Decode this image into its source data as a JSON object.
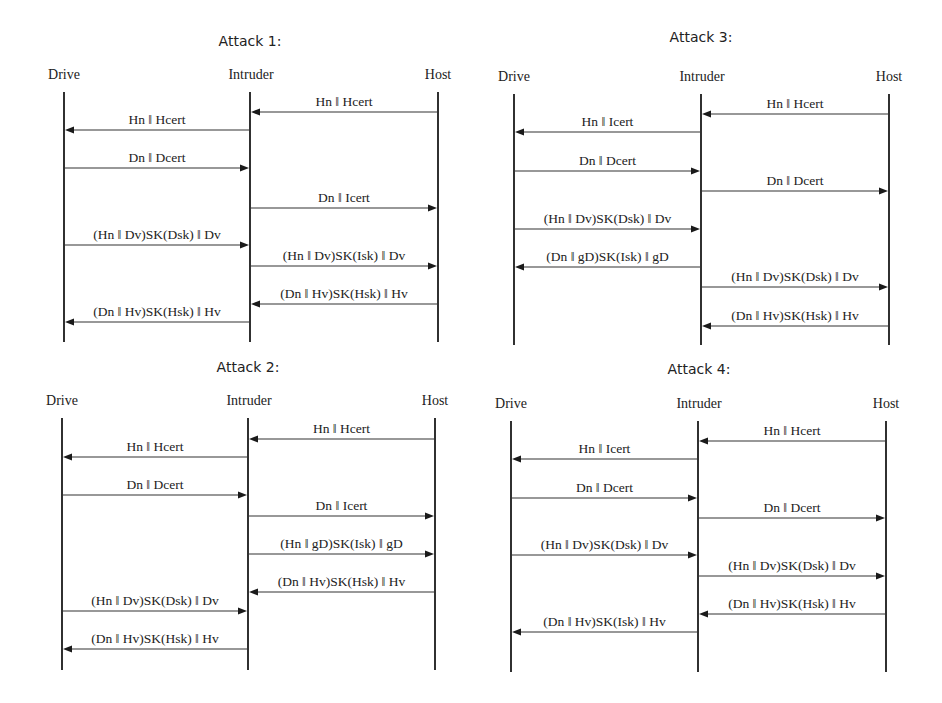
{
  "diagrams": [
    {
      "id": "attack-1",
      "title": "Attack 1:",
      "title_pos": {
        "x": 250,
        "y": 46
      },
      "header_y": 79,
      "lifeline_top": 92,
      "lifeline_bottom": 342,
      "actors": [
        {
          "name": "Drive",
          "x": 64,
          "label_x": 64
        },
        {
          "name": "Intruder",
          "x": 250,
          "label_x": 251
        },
        {
          "name": "Host",
          "x": 438,
          "label_x": 438
        }
      ],
      "messages": [
        {
          "from": "Host",
          "to": "Intruder",
          "label": "Hn ‖ Hcert",
          "y": 112
        },
        {
          "from": "Intruder",
          "to": "Drive",
          "label": "Hn ‖ Hcert",
          "y": 130
        },
        {
          "from": "Drive",
          "to": "Intruder",
          "label": "Dn ‖ Dcert",
          "y": 168
        },
        {
          "from": "Intruder",
          "to": "Host",
          "label": "Dn ‖ Icert",
          "y": 208
        },
        {
          "from": "Drive",
          "to": "Intruder",
          "label": "(Hn ‖ Dv)SK(Dsk) ‖ Dv",
          "y": 245
        },
        {
          "from": "Intruder",
          "to": "Host",
          "label": "(Hn ‖ Dv)SK(Isk) ‖ Dv",
          "y": 266
        },
        {
          "from": "Host",
          "to": "Intruder",
          "label": "(Dn ‖ Hv)SK(Hsk) ‖ Hv",
          "y": 304
        },
        {
          "from": "Intruder",
          "to": "Drive",
          "label": "(Dn ‖ Hv)SK(Hsk) ‖ Hv",
          "y": 322
        }
      ]
    },
    {
      "id": "attack-3",
      "title": "Attack 3:",
      "title_pos": {
        "x": 701,
        "y": 42
      },
      "header_y": 81,
      "lifeline_top": 94,
      "lifeline_bottom": 345,
      "actors": [
        {
          "name": "Drive",
          "x": 514,
          "label_x": 514
        },
        {
          "name": "Intruder",
          "x": 701,
          "label_x": 702
        },
        {
          "name": "Host",
          "x": 889,
          "label_x": 889
        }
      ],
      "messages": [
        {
          "from": "Host",
          "to": "Intruder",
          "label": "Hn ‖ Hcert",
          "y": 114
        },
        {
          "from": "Intruder",
          "to": "Drive",
          "label": "Hn ‖ Icert",
          "y": 132
        },
        {
          "from": "Drive",
          "to": "Intruder",
          "label": "Dn ‖ Dcert",
          "y": 171
        },
        {
          "from": "Intruder",
          "to": "Host",
          "label": "Dn ‖ Dcert",
          "y": 191
        },
        {
          "from": "Drive",
          "to": "Intruder",
          "label": "(Hn ‖ Dv)SK(Dsk) ‖ Dv",
          "y": 229
        },
        {
          "from": "Intruder",
          "to": "Drive",
          "label": "(Dn ‖ gD)SK(Isk) ‖ gD",
          "y": 267
        },
        {
          "from": "Intruder",
          "to": "Host",
          "label": "(Hn ‖ Dv)SK(Dsk) ‖ Dv",
          "y": 287
        },
        {
          "from": "Host",
          "to": "Intruder",
          "label": "(Dn ‖ Hv)SK(Hsk) ‖ Hv",
          "y": 326
        }
      ]
    },
    {
      "id": "attack-2",
      "title": "Attack 2:",
      "title_pos": {
        "x": 248,
        "y": 372
      },
      "header_y": 405,
      "lifeline_top": 418,
      "lifeline_bottom": 670,
      "actors": [
        {
          "name": "Drive",
          "x": 62,
          "label_x": 62
        },
        {
          "name": "Intruder",
          "x": 248,
          "label_x": 249
        },
        {
          "name": "Host",
          "x": 435,
          "label_x": 435
        }
      ],
      "messages": [
        {
          "from": "Host",
          "to": "Intruder",
          "label": "Hn ‖ Hcert",
          "y": 439
        },
        {
          "from": "Intruder",
          "to": "Drive",
          "label": "Hn ‖ Hcert",
          "y": 457
        },
        {
          "from": "Drive",
          "to": "Intruder",
          "label": "Dn ‖ Dcert",
          "y": 495
        },
        {
          "from": "Intruder",
          "to": "Host",
          "label": "Dn ‖ Icert",
          "y": 516
        },
        {
          "from": "Intruder",
          "to": "Host",
          "label": "(Hn ‖ gD)SK(Isk) ‖ gD",
          "y": 554
        },
        {
          "from": "Host",
          "to": "Intruder",
          "label": "(Dn ‖ Hv)SK(Hsk) ‖ Hv",
          "y": 592
        },
        {
          "from": "Drive",
          "to": "Intruder",
          "label": "(Hn ‖ Dv)SK(Dsk) ‖ Dv",
          "y": 611
        },
        {
          "from": "Intruder",
          "to": "Drive",
          "label": "(Dn ‖ Hv)SK(Hsk) ‖ Hv",
          "y": 649
        }
      ]
    },
    {
      "id": "attack-4",
      "title": "Attack 4:",
      "title_pos": {
        "x": 699,
        "y": 374
      },
      "header_y": 408,
      "lifeline_top": 421,
      "lifeline_bottom": 672,
      "actors": [
        {
          "name": "Drive",
          "x": 511,
          "label_x": 511
        },
        {
          "name": "Intruder",
          "x": 698,
          "label_x": 699
        },
        {
          "name": "Host",
          "x": 886,
          "label_x": 886
        }
      ],
      "messages": [
        {
          "from": "Host",
          "to": "Intruder",
          "label": "Hn ‖ Hcert",
          "y": 441
        },
        {
          "from": "Intruder",
          "to": "Drive",
          "label": "Hn ‖ Icert",
          "y": 459
        },
        {
          "from": "Drive",
          "to": "Intruder",
          "label": "Dn ‖ Dcert",
          "y": 498
        },
        {
          "from": "Intruder",
          "to": "Host",
          "label": "Dn ‖ Dcert",
          "y": 518
        },
        {
          "from": "Drive",
          "to": "Intruder",
          "label": "(Hn ‖ Dv)SK(Dsk) ‖ Dv",
          "y": 555
        },
        {
          "from": "Intruder",
          "to": "Host",
          "label": "(Hn ‖ Dv)SK(Dsk) ‖ Dv",
          "y": 576
        },
        {
          "from": "Host",
          "to": "Intruder",
          "label": "(Dn ‖ Hv)SK(Hsk) ‖ Hv",
          "y": 614
        },
        {
          "from": "Intruder",
          "to": "Drive",
          "label": "(Dn ‖ Hv)SK(Isk) ‖ Hv",
          "y": 632
        }
      ]
    }
  ]
}
